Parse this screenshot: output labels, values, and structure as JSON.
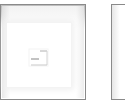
{
  "thumbnails": [
    {
      "name": "thumbnail-1",
      "icon": "document-icon",
      "selected": false
    },
    {
      "name": "thumbnail-2",
      "icon": null,
      "selected": false
    }
  ],
  "colors": {
    "border": "#8a8a8a",
    "shade": "#bdbdbd",
    "background": "#ffffff"
  }
}
